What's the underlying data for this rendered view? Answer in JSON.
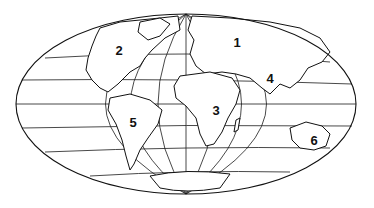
{
  "map": {
    "projection": "mollweide-like world outline",
    "regions": [
      {
        "id": "1",
        "label": "1",
        "x": 237,
        "y": 42
      },
      {
        "id": "2",
        "label": "2",
        "x": 119,
        "y": 50
      },
      {
        "id": "3",
        "label": "3",
        "x": 216,
        "y": 110
      },
      {
        "id": "4",
        "label": "4",
        "x": 270,
        "y": 78
      },
      {
        "id": "5",
        "label": "5",
        "x": 133,
        "y": 122
      },
      {
        "id": "6",
        "label": "6",
        "x": 314,
        "y": 140
      }
    ]
  }
}
